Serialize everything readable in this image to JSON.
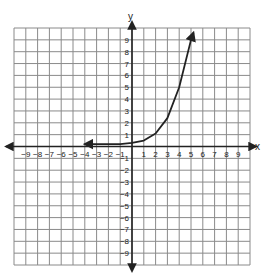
{
  "chart_data": {
    "type": "line",
    "title": "",
    "xlabel": "x",
    "ylabel": "y",
    "xlim": [
      -10,
      10
    ],
    "ylim": [
      -10,
      10
    ],
    "grid": true,
    "x_ticks": [
      -9,
      -8,
      -7,
      -6,
      -5,
      -4,
      -3,
      -2,
      -1,
      1,
      2,
      3,
      4,
      5,
      6,
      7,
      8,
      9
    ],
    "y_ticks": [
      9,
      8,
      7,
      6,
      5,
      4,
      3,
      2,
      1,
      -1,
      -2,
      -3,
      -4,
      -5,
      -6,
      -7,
      -8,
      -9
    ],
    "series": [
      {
        "name": "exponential curve",
        "description": "Exponential growth curve with horizontal asymptote near y=0; arrows at both ends",
        "x": [
          -4,
          -3,
          -2,
          -1,
          0,
          1,
          2,
          3,
          4,
          5,
          5.2
        ],
        "y": [
          0.2,
          0.2,
          0.2,
          0.2,
          0.3,
          0.5,
          1.1,
          2.4,
          5,
          9,
          9.6
        ],
        "arrow_left_end": [
          -4,
          0.2
        ],
        "arrow_right_end": [
          5.2,
          9.6
        ]
      }
    ]
  },
  "colors": {
    "grid": "#8a8a8a",
    "axis": "#222222",
    "curve": "#222222",
    "background": "#ffffff"
  }
}
